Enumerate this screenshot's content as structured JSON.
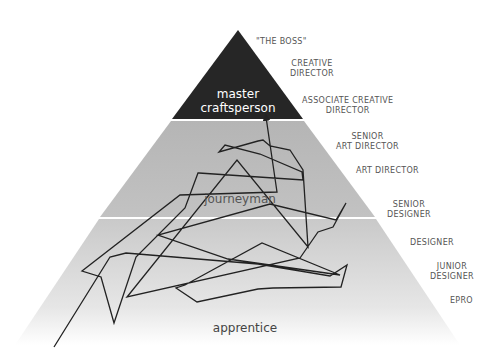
{
  "tiers": [
    {
      "id": "master",
      "line1": "master",
      "line2": "craftsperson",
      "text_color": "#ffffff",
      "fill": "#262626"
    },
    {
      "id": "journeyman",
      "label": "journeyman",
      "text_color": "#555555",
      "fill": "#b9b9b9"
    },
    {
      "id": "apprentice",
      "label": "apprentice",
      "text_color": "#444444",
      "fill": "#d8d8d8"
    }
  ],
  "roles": [
    {
      "line1": "\"THE BOSS\"",
      "line2": ""
    },
    {
      "line1": "CREATIVE",
      "line2": "DIRECTOR"
    },
    {
      "line1": "ASSOCIATE CREATIVE",
      "line2": "DIRECTOR"
    },
    {
      "line1": "SENIOR",
      "line2": "ART DIRECTOR"
    },
    {
      "line1": "ART DIRECTOR",
      "line2": ""
    },
    {
      "line1": "SENIOR",
      "line2": "DESIGNER"
    },
    {
      "line1": "DESIGNER",
      "line2": ""
    },
    {
      "line1": "JUNIOR",
      "line2": "DESIGNER"
    },
    {
      "line1": "EPRO",
      "line2": ""
    }
  ],
  "path": {
    "description": "Zig-zag career path arrow from bottom-left to master tier",
    "color": "#222222"
  }
}
